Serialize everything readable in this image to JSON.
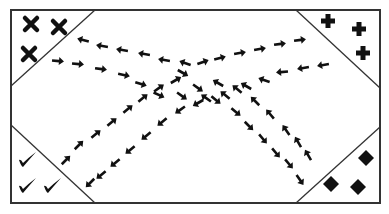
{
  "diagram": {
    "colors": {
      "ink": "#111111",
      "border": "#333333",
      "background": "#ffffff"
    },
    "border": {
      "x": 11,
      "y": 10,
      "w": 369,
      "h": 193
    },
    "corners": [
      {
        "id": "top-left",
        "symbol": "x-mark",
        "triangle": [
          [
            11,
            10
          ],
          [
            95,
            10
          ],
          [
            11,
            86
          ]
        ],
        "marks": [
          [
            31,
            24
          ],
          [
            59,
            27
          ],
          [
            29,
            54
          ]
        ]
      },
      {
        "id": "top-right",
        "symbol": "plus",
        "triangle": [
          [
            296,
            10
          ],
          [
            380,
            10
          ],
          [
            380,
            88
          ]
        ],
        "marks": [
          [
            328,
            21
          ],
          [
            359,
            29
          ],
          [
            363,
            53
          ]
        ]
      },
      {
        "id": "bottom-left",
        "symbol": "check",
        "triangle": [
          [
            11,
            125
          ],
          [
            95,
            203
          ],
          [
            11,
            203
          ]
        ],
        "marks": [
          [
            27,
            160
          ],
          [
            27,
            186
          ],
          [
            52,
            186
          ]
        ]
      },
      {
        "id": "bottom-right",
        "symbol": "diamond",
        "triangle": [
          [
            380,
            127
          ],
          [
            380,
            203
          ],
          [
            296,
            203
          ]
        ],
        "marks": [
          [
            366,
            158
          ],
          [
            331,
            184
          ],
          [
            358,
            187
          ]
        ]
      }
    ],
    "paths": [
      {
        "name": "center-to-top-left",
        "arrows": [
          [
            185,
            63,
            200
          ],
          [
            164,
            60,
            190
          ],
          [
            144,
            54,
            190
          ],
          [
            122,
            50,
            190
          ],
          [
            102,
            46,
            190
          ],
          [
            83,
            40,
            195
          ]
        ]
      },
      {
        "name": "top-left-to-center",
        "arrows": [
          [
            58,
            61,
            5
          ],
          [
            78,
            64,
            5
          ],
          [
            101,
            69,
            8
          ],
          [
            124,
            75,
            12
          ],
          [
            141,
            84,
            18
          ],
          [
            159,
            95,
            25
          ],
          [
            182,
            96,
            35
          ]
        ]
      },
      {
        "name": "center-to-top-right",
        "arrows": [
          [
            203,
            62,
            -20
          ],
          [
            220,
            58,
            -15
          ],
          [
            240,
            53,
            -10
          ],
          [
            260,
            49,
            -10
          ],
          [
            280,
            44,
            -8
          ],
          [
            300,
            40,
            -8
          ]
        ]
      },
      {
        "name": "top-right-to-center",
        "arrows": [
          [
            323,
            65,
            170
          ],
          [
            303,
            68,
            170
          ],
          [
            282,
            72,
            175
          ],
          [
            264,
            80,
            200
          ],
          [
            246,
            86,
            210
          ],
          [
            225,
            95,
            220
          ],
          [
            206,
            98,
            215
          ]
        ]
      },
      {
        "name": "center-to-bottom-left",
        "arrows": [
          [
            198,
            103,
            150
          ],
          [
            180,
            110,
            145
          ],
          [
            162,
            122,
            140
          ],
          [
            146,
            136,
            140
          ],
          [
            130,
            150,
            140
          ],
          [
            115,
            163,
            140
          ],
          [
            101,
            175,
            140
          ],
          [
            90,
            183,
            135
          ]
        ]
      },
      {
        "name": "bottom-left-to-center",
        "arrows": [
          [
            66,
            160,
            -45
          ],
          [
            79,
            145,
            -45
          ],
          [
            96,
            134,
            -40
          ],
          [
            112,
            122,
            -40
          ],
          [
            128,
            109,
            -40
          ],
          [
            143,
            98,
            -40
          ],
          [
            159,
            88,
            -35
          ],
          [
            176,
            80,
            -30
          ]
        ]
      },
      {
        "name": "center-to-bottom-right",
        "arrows": [
          [
            183,
            73,
            30
          ],
          [
            198,
            88,
            35
          ],
          [
            216,
            100,
            40
          ],
          [
            236,
            112,
            40
          ],
          [
            249,
            126,
            45
          ],
          [
            263,
            139,
            50
          ],
          [
            276,
            153,
            50
          ],
          [
            289,
            164,
            50
          ],
          [
            300,
            180,
            55
          ]
        ]
      },
      {
        "name": "bottom-right-to-center",
        "arrows": [
          [
            308,
            155,
            -120
          ],
          [
            298,
            142,
            -120
          ],
          [
            286,
            130,
            -125
          ],
          [
            270,
            114,
            -130
          ],
          [
            255,
            101,
            -135
          ],
          [
            237,
            89,
            -140
          ],
          [
            218,
            83,
            -150
          ]
        ]
      }
    ]
  }
}
